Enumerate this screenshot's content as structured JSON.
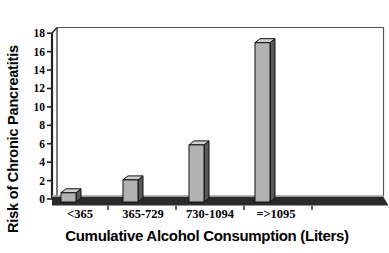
{
  "chart_data": {
    "type": "bar",
    "style": "3d-column",
    "title": "",
    "categories": [
      "<365",
      "365-729",
      "730-1094",
      "=>1095"
    ],
    "values": [
      1,
      2.4,
      6.2,
      17.3
    ],
    "xlabel": "Cumulative Alcohol Consumption (Liters)",
    "ylabel": "Risk of Chronic Pancreatitis",
    "ylim": [
      0,
      18
    ],
    "yticks": [
      0,
      2,
      4,
      6,
      8,
      10,
      12,
      14,
      16,
      18
    ],
    "grid": false,
    "legend": null,
    "colors": {
      "bar_front": "#b2b2b2",
      "bar_top": "#cfcfcf",
      "bar_side": "#585858",
      "bar_outline": "#111111",
      "floor_front": "#2a2a2a",
      "floor_top_edge": "#9a9a9a",
      "axis_line": "#222222",
      "border_line": "#555555",
      "text": "#000000"
    }
  }
}
